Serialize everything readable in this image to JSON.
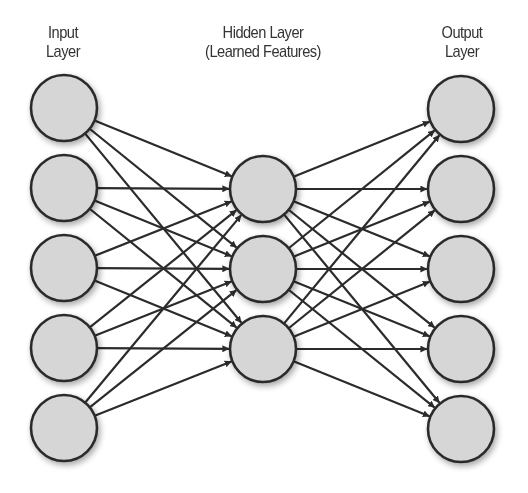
{
  "diagram": {
    "type": "fully-connected feedforward network",
    "colors": {
      "background": "#ffffff",
      "node_fill": "#d6d6d6",
      "node_stroke": "#2b2b2b",
      "edge": "#2b2b2b",
      "label_text": "#333333"
    },
    "node_radius": 33,
    "layers": [
      {
        "id": "input",
        "label_line1": "Input",
        "label_line2": "Layer",
        "x": 64,
        "node_count": 5,
        "nodes_y": [
          108,
          188,
          268,
          348,
          428
        ]
      },
      {
        "id": "hidden",
        "label_line1": "Hidden Layer",
        "label_line2": "(Learned Features)",
        "x": 263,
        "node_count": 3,
        "nodes_y": [
          189,
          269,
          349
        ]
      },
      {
        "id": "output",
        "label_line1": "Output",
        "label_line2": "Layer",
        "x": 461,
        "node_count": 5,
        "nodes_y": [
          109,
          189,
          269,
          349,
          429
        ]
      }
    ],
    "connections": [
      {
        "from": "input",
        "to": "hidden",
        "pattern": "all-to-all",
        "arrowheads": true
      },
      {
        "from": "hidden",
        "to": "output",
        "pattern": "all-to-all",
        "arrowheads": true
      }
    ]
  }
}
